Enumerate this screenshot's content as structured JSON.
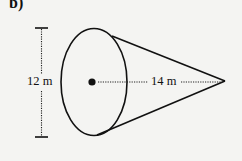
{
  "figure": {
    "part_label": "b)",
    "shape": "cone",
    "orientation": "horizontal, apex pointing right",
    "dimensions": {
      "base_diameter_label": "12 m",
      "height_label": "14 m"
    },
    "colors": {
      "background": "#f4f4f2",
      "stroke": "#111111"
    }
  }
}
